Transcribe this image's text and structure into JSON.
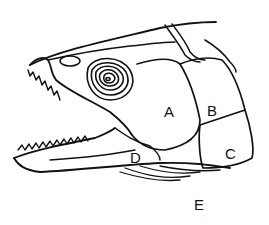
{
  "figure": {
    "line_color": "#111111",
    "background": "#ffffff",
    "labels": [
      {
        "id": "A",
        "text": "A",
        "x": 170,
        "y": 106
      },
      {
        "id": "B",
        "text": "B",
        "x": 212,
        "y": 104
      },
      {
        "id": "C",
        "text": "C",
        "x": 226,
        "y": 146
      },
      {
        "id": "D",
        "text": "D",
        "x": 130,
        "y": 150
      },
      {
        "id": "E",
        "text": "E",
        "x": 195,
        "y": 196
      }
    ]
  }
}
